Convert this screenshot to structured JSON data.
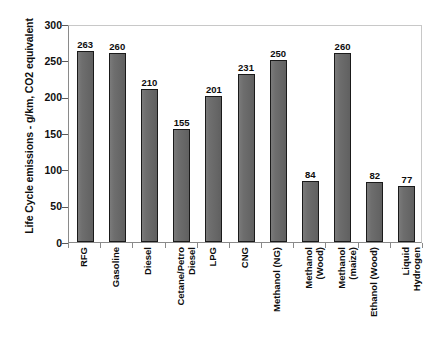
{
  "chart_data": {
    "type": "bar",
    "title": "",
    "xlabel": "",
    "ylabel": "Life Cycle emissions - g/km, CO2 equivalent",
    "ylim": [
      0,
      300
    ],
    "yticks": [
      0,
      50,
      100,
      150,
      200,
      250,
      300
    ],
    "grid": false,
    "legend": "none",
    "bar_color": "#6b6b6b",
    "bar_edge_color": "#1a1a1a",
    "plot_border_color": "#c8c8c8",
    "axis_color": "#8a8a8a",
    "text_color": "#101010",
    "categories": [
      "RFG",
      "Gasoline",
      "Diesel",
      "Cetane/Petro\nDiesel",
      "LPG",
      "CNG",
      "Methanol (NG)",
      "Methanol\n(Wood)",
      "Methanol\n(maize)",
      "Ethanol (Wood)",
      "Liquid\nHydrogen"
    ],
    "values": [
      263,
      260,
      210,
      155,
      201,
      231,
      250,
      84,
      260,
      82,
      77
    ],
    "value_labels": [
      "263",
      "260",
      "210",
      "155",
      "201",
      "231",
      "250",
      "84",
      "260",
      "82",
      "77"
    ],
    "ytick_labels": [
      "0",
      "50",
      "100",
      "150",
      "200",
      "250",
      "300"
    ]
  }
}
